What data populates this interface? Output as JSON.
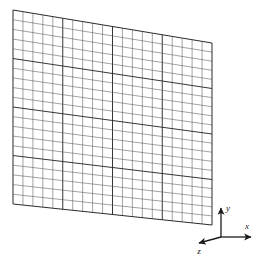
{
  "figure": {
    "title": "",
    "background_color": "#ffffff",
    "width": 265,
    "height": 262
  },
  "mesh": {
    "name": "structured-quadrilateral-mesh",
    "description": "Flat rectangular plate discretized into a structured quadrilateral grid, shown in oblique 3D view",
    "columns": 20,
    "rows": 20,
    "line_color": "#555555",
    "accent_line_color": "#2b2b2b",
    "outline_color": "#2b2b2b",
    "accent_every": 5,
    "fill_color": "#ffffff",
    "corners": {
      "top_left": [
        13,
        10
      ],
      "top_right": [
        212,
        43
      ],
      "bottom_right": [
        212,
        225
      ],
      "bottom_left": [
        13,
        204
      ]
    }
  },
  "axes_triad": {
    "name": "coordinate-axes-triad",
    "origin": [
      221,
      237
    ],
    "color": "#1a1a1a",
    "axes": [
      {
        "id": "y",
        "label": "y",
        "tip": [
          221,
          208
        ],
        "label_pos": [
          228,
          211
        ]
      },
      {
        "id": "x",
        "label": "x",
        "tip": [
          251,
          237
        ],
        "label_pos": [
          247,
          229
        ]
      },
      {
        "id": "z",
        "label": "z",
        "tip": [
          199,
          243
        ],
        "label_pos": [
          199,
          254
        ]
      }
    ]
  }
}
